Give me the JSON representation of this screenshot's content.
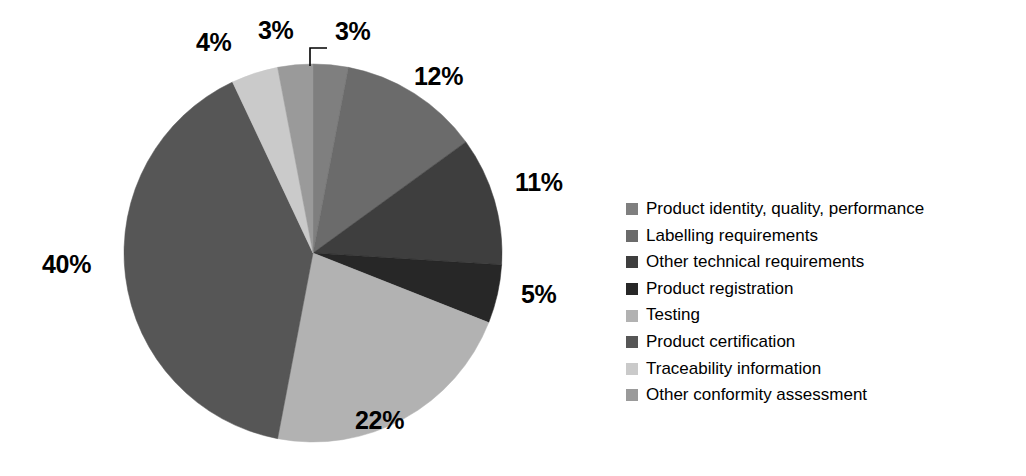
{
  "chart_data": {
    "type": "pie",
    "title": "",
    "subtitle": "",
    "xlabel": "",
    "ylabel": "",
    "grid": false,
    "legend_position": "right",
    "start_angle_deg": 0,
    "direction": "clockwise",
    "categories": [
      "Product identity, quality, performance",
      "Labelling requirements",
      "Other technical requirements",
      "Product registration",
      "Testing",
      "Product certification",
      "Traceability information",
      "Other conformity assessment"
    ],
    "values": [
      3,
      12,
      11,
      5,
      22,
      40,
      4,
      3
    ],
    "value_labels": [
      "3%",
      "12%",
      "11%",
      "5%",
      "22%",
      "40%",
      "4%",
      "3%"
    ],
    "colors": [
      "#7f7f7f",
      "#6b6b6b",
      "#3e3e3e",
      "#272727",
      "#b2b2b2",
      "#565656",
      "#cacaca",
      "#9a9a9a"
    ],
    "units": "percent",
    "total": 100
  },
  "pie": {
    "center_x": 313,
    "center_y": 253,
    "radius": 189,
    "slices": [
      {
        "label": "Product identity, quality, performance",
        "value": 3,
        "value_label": "3%",
        "color": "#7f7f7f",
        "start_deg": 0.0,
        "end_deg": 10.8
      },
      {
        "label": "Labelling requirements",
        "value": 12,
        "value_label": "12%",
        "color": "#6b6b6b",
        "start_deg": 10.8,
        "end_deg": 54.0
      },
      {
        "label": "Other technical requirements",
        "value": 11,
        "value_label": "11%",
        "color": "#3e3e3e",
        "start_deg": 54.0,
        "end_deg": 93.6
      },
      {
        "label": "Product registration",
        "value": 5,
        "value_label": "5%",
        "color": "#272727",
        "start_deg": 93.6,
        "end_deg": 111.6
      },
      {
        "label": "Testing",
        "value": 22,
        "value_label": "22%",
        "color": "#b2b2b2",
        "start_deg": 111.6,
        "end_deg": 190.8
      },
      {
        "label": "Product certification",
        "value": 40,
        "value_label": "40%",
        "color": "#565656",
        "start_deg": 190.8,
        "end_deg": 334.8
      },
      {
        "label": "Traceability information",
        "value": 4,
        "value_label": "4%",
        "color": "#cacaca",
        "start_deg": 334.8,
        "end_deg": 349.2
      },
      {
        "label": "Other conformity assessment",
        "value": 3,
        "value_label": "3%",
        "color": "#9a9a9a",
        "start_deg": 349.2,
        "end_deg": 360.0
      }
    ]
  },
  "labels": {
    "pct_4": "4%",
    "pct_3a": "3%",
    "pct_3b": "3%",
    "pct_12": "12%",
    "pct_11": "11%",
    "pct_5": "5%",
    "pct_22": "22%",
    "pct_40": "40%"
  },
  "legend": {
    "items": [
      {
        "label": "Product identity, quality, performance",
        "color": "#7f7f7f"
      },
      {
        "label": "Labelling requirements",
        "color": "#6b6b6b"
      },
      {
        "label": "Other technical requirements",
        "color": "#3e3e3e"
      },
      {
        "label": "Product registration",
        "color": "#272727"
      },
      {
        "label": "Testing",
        "color": "#b2b2b2"
      },
      {
        "label": "Product certification",
        "color": "#565656"
      },
      {
        "label": "Traceability information",
        "color": "#cacaca"
      },
      {
        "label": "Other conformity assessment",
        "color": "#9a9a9a"
      }
    ]
  }
}
